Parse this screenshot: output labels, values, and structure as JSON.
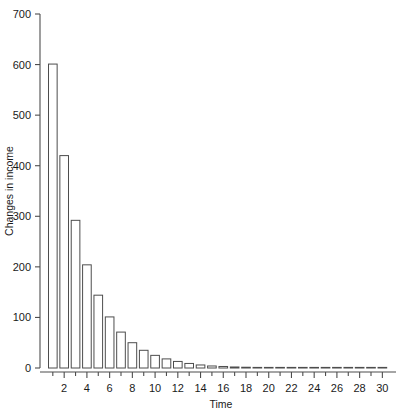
{
  "chart_data": {
    "type": "bar",
    "title": "",
    "subtitle": "",
    "xlabel": "Time",
    "ylabel": "Changes in income",
    "xlim": [
      0.4,
      31.2
    ],
    "ylim": [
      0,
      700
    ],
    "grid": false,
    "legend": null,
    "bar_color": "#ffffff",
    "bar_edge_color": "#4d4d4d",
    "axis_color": "#4d4d4d",
    "x_tick_labels": [
      "2",
      "4",
      "6",
      "8",
      "10",
      "12",
      "14",
      "16",
      "18",
      "20",
      "22",
      "24",
      "26",
      "28",
      "30"
    ],
    "x_tick_values": [
      2,
      4,
      6,
      8,
      10,
      12,
      14,
      16,
      18,
      20,
      22,
      24,
      26,
      28,
      30
    ],
    "x_minor_ticks": [
      1,
      2,
      3,
      4,
      5,
      6,
      7,
      8,
      9,
      10,
      11,
      12,
      13,
      14,
      15,
      16,
      17,
      18,
      19,
      20,
      21,
      22,
      23,
      24,
      25,
      26,
      27,
      28,
      29,
      30
    ],
    "y_tick_labels": [
      "0",
      "100",
      "200",
      "300",
      "400",
      "500",
      "600",
      "700"
    ],
    "y_tick_values": [
      0,
      100,
      200,
      300,
      400,
      500,
      600,
      700
    ],
    "categories": [
      1,
      2,
      3,
      4,
      5,
      6,
      7,
      8,
      9,
      10,
      11,
      12,
      13,
      14,
      15,
      16,
      17,
      18,
      19,
      20,
      21,
      22,
      23,
      24,
      25,
      26,
      27,
      28,
      29,
      30
    ],
    "values": [
      601,
      420,
      292,
      204,
      144,
      101,
      71,
      50,
      35,
      25,
      18,
      13,
      9,
      6,
      4,
      3,
      2,
      1.5,
      1,
      0.8,
      0.5,
      0.4,
      0.3,
      0.2,
      0.15,
      0.1,
      0.08,
      0.05,
      0.04,
      0.03
    ]
  }
}
